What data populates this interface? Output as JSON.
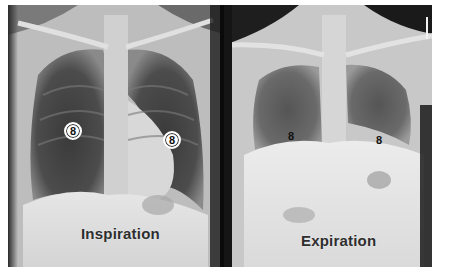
{
  "figure": {
    "panels": [
      {
        "id": "inspiration",
        "label": "Inspiration",
        "markers": [
          {
            "text": "8",
            "style": "circled",
            "side": "right-lung"
          },
          {
            "text": "8",
            "style": "circled",
            "side": "left-lung"
          }
        ]
      },
      {
        "id": "expiration",
        "label": "Expiration",
        "markers": [
          {
            "text": "8",
            "style": "plain",
            "side": "right-lung"
          },
          {
            "text": "8",
            "style": "plain",
            "side": "left-lung"
          }
        ]
      }
    ],
    "colors": {
      "background": "#ffffff",
      "divider": "#0a0a0a",
      "label_text": "#2e2e2e"
    }
  }
}
